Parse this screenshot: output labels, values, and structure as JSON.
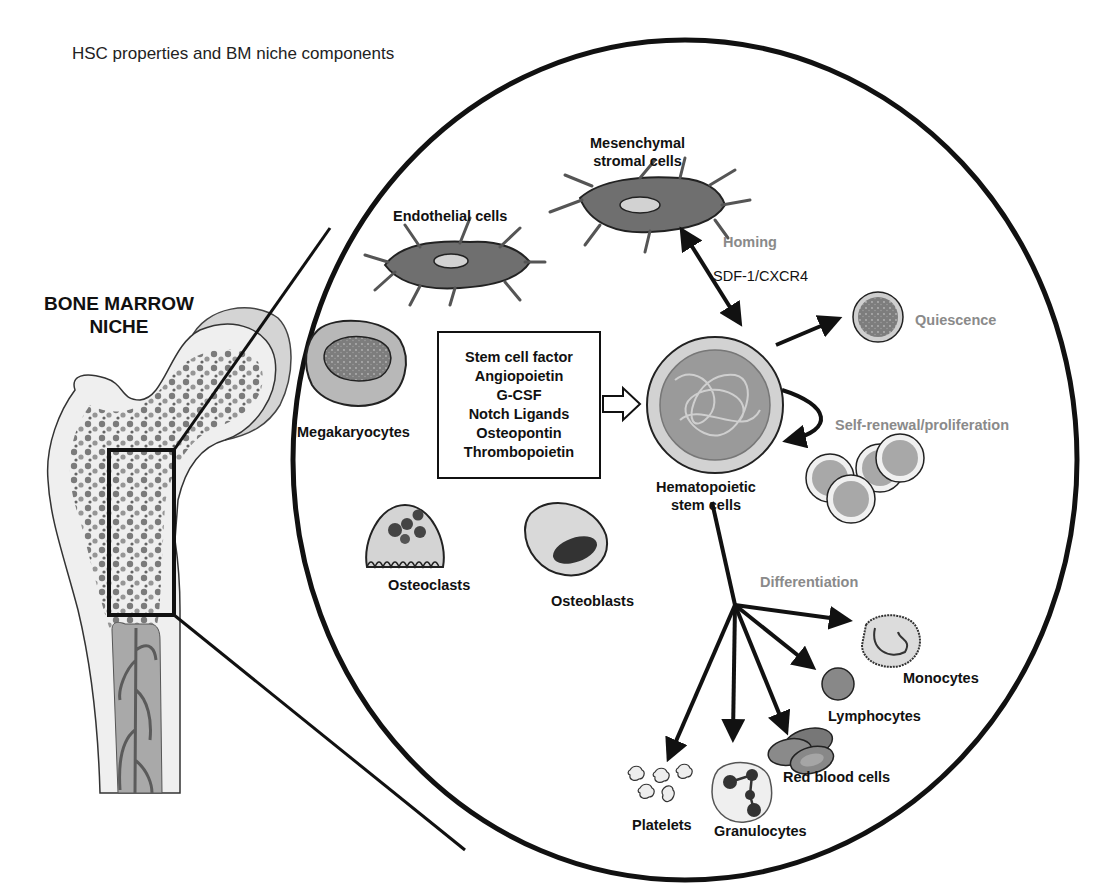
{
  "title": "HSC properties and BM niche components",
  "bone": {
    "label_line1": "BONE MARROW",
    "label_line2": "NICHE"
  },
  "niche_cells": {
    "mesenchymal": {
      "line1": "Mesenchymal",
      "line2": "stromal cells"
    },
    "endothelial": "Endothelial cells",
    "megakaryocytes": "Megakaryocytes",
    "osteoclasts": "Osteoclasts",
    "osteoblasts": "Osteoblasts"
  },
  "factors": {
    "items": [
      "Stem cell factor",
      "Angiopoietin",
      "G-CSF",
      "Notch Ligands",
      "Osteopontin",
      "Thrombopoietin"
    ]
  },
  "hsc": {
    "line1": "Hematopoietic",
    "line2": "stem cells"
  },
  "properties": {
    "homing": "Homing",
    "homing_axis": "SDF-1/CXCR4",
    "quiescence": "Quiescence",
    "self_renewal": "Self-renewal/proliferation",
    "differentiation": "Differentiation"
  },
  "progeny": {
    "monocytes": "Monocytes",
    "lymphocytes": "Lymphocytes",
    "red_blood_cells": "Red blood cells",
    "granulocytes": "Granulocytes",
    "platelets": "Platelets"
  },
  "colors": {
    "property_label": "#8a8a8a",
    "cell_dark": "#6b6b6b",
    "cell_light": "#d8d8d8",
    "outline": "#111111"
  }
}
